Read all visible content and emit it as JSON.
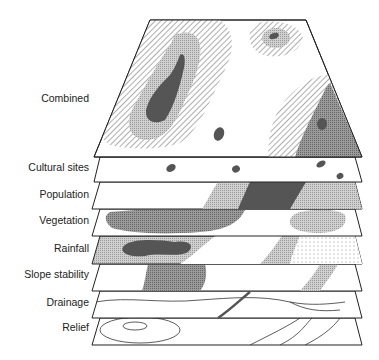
{
  "diagram": {
    "type": "layered-overlay",
    "layers": [
      {
        "label": "Combined",
        "label_y": 92
      },
      {
        "label": "Cultural sites",
        "label_y": 161
      },
      {
        "label": "Population",
        "label_y": 188
      },
      {
        "label": "Vegetation",
        "label_y": 214
      },
      {
        "label": "Rainfall",
        "label_y": 242
      },
      {
        "label": "Slope stability",
        "label_y": 268
      },
      {
        "label": "Drainage",
        "label_y": 296
      },
      {
        "label": "Relief",
        "label_y": 321
      }
    ],
    "colors": {
      "dark": "#555555",
      "mid": "#8a8a8a",
      "light": "#c4c4c4",
      "outline": "#222222"
    }
  }
}
